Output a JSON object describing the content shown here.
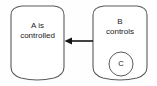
{
  "diagram": {
    "canvas": {
      "width": 157,
      "height": 86,
      "background_color": "#fefefe"
    },
    "style": {
      "node_stroke_color": "#5a5a5a",
      "node_fill_color": "#ffffff",
      "edge_color": "#141414",
      "text_color": "#1a1a1a"
    },
    "nodes": [
      {
        "id": "node-a",
        "shape": "cylinder",
        "label_line1": "A is",
        "label_line2": "controlled",
        "x": 10,
        "y": 6,
        "width": 55,
        "height": 74
      },
      {
        "id": "node-b",
        "shape": "cylinder",
        "label_line1": "B",
        "label_line2": "controls",
        "x": 92,
        "y": 6,
        "width": 56,
        "height": 74
      }
    ],
    "inner_elements": [
      {
        "id": "circle-c",
        "shape": "circle",
        "label": "C",
        "parent": "node-b",
        "cx": 121,
        "cy": 64,
        "r": 12
      }
    ],
    "edges": [
      {
        "id": "edge-b-to-a",
        "from": "node-b",
        "to": "node-a",
        "direction": "left",
        "label": "",
        "start_x": 92,
        "end_x": 65,
        "y": 41
      }
    ]
  }
}
